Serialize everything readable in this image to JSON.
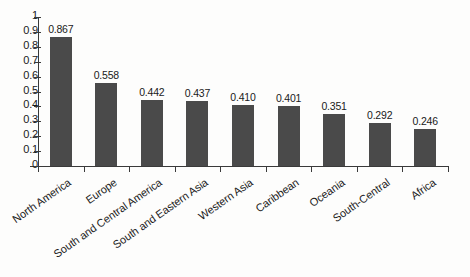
{
  "chart_data": {
    "type": "bar",
    "title": "",
    "xlabel": "",
    "ylabel": "",
    "ylim": [
      0,
      1
    ],
    "ytick_labels": [
      "1",
      "0.9",
      "0.8",
      "0.7",
      "0.6",
      "0.5",
      "0.4",
      "0.3",
      "0.2",
      "0.1",
      "0"
    ],
    "ytick_values": [
      1,
      0.9,
      0.8,
      0.7,
      0.6,
      0.5,
      0.4,
      0.3,
      0.2,
      0.1,
      0
    ],
    "grid": false,
    "legend": "none",
    "bar_color": "#4a4a4a",
    "axis_color": "#3a3a3a",
    "background": "#fdfdfc",
    "categories": [
      "North America",
      "Europe",
      "South and Central America",
      "South and Eastern Asia",
      "Western Asia",
      "Caribbean",
      "Oceania",
      "South-Central",
      "Africa"
    ],
    "values": [
      0.867,
      0.558,
      0.442,
      0.437,
      0.41,
      0.401,
      0.351,
      0.292,
      0.246
    ],
    "value_labels": [
      "0.867",
      "0.558",
      "0.442",
      "0.437",
      "0.410",
      "0.401",
      "0.351",
      "0.292",
      "0.246"
    ]
  }
}
